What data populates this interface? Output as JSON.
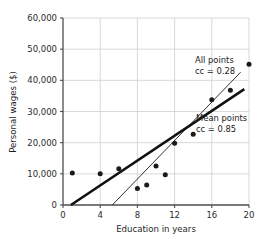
{
  "chart_data": {
    "type": "scatter",
    "title": "",
    "xlabel": "Education in years",
    "ylabel": "Personal wages ($)",
    "xlim": [
      0,
      20
    ],
    "ylim": [
      0,
      60000
    ],
    "grid": true,
    "legend_position": "inline-annotations",
    "xticks": [
      0,
      4,
      8,
      12,
      16,
      20
    ],
    "xtick_labels": [
      "0",
      "4",
      "8",
      "12",
      "16",
      "20"
    ],
    "yticks": [
      0,
      10000,
      20000,
      30000,
      40000,
      50000,
      60000
    ],
    "ytick_labels": [
      "0",
      "10,000",
      "20,000",
      "30,000",
      "40,000",
      "50,000",
      "60,000"
    ],
    "points": [
      {
        "x": 1.0,
        "y": 10300
      },
      {
        "x": 4.0,
        "y": 10000
      },
      {
        "x": 6.0,
        "y": 11600
      },
      {
        "x": 8.0,
        "y": 5300
      },
      {
        "x": 9.0,
        "y": 6400
      },
      {
        "x": 10.0,
        "y": 12500
      },
      {
        "x": 11.0,
        "y": 9700
      },
      {
        "x": 12.0,
        "y": 19800
      },
      {
        "x": 14.0,
        "y": 22700
      },
      {
        "x": 16.0,
        "y": 33800
      },
      {
        "x": 18.0,
        "y": 36800
      },
      {
        "x": 20.0,
        "y": 45200
      }
    ],
    "series": [
      {
        "name": "All points",
        "cc_label": "cc = 0.28",
        "cc": 0.28,
        "type": "line",
        "style": "thin",
        "x_start": 5.3,
        "y_start": 0,
        "x_end": 19.1,
        "y_end": 42600
      },
      {
        "name": "Mean points",
        "cc_label": "cc = 0.85",
        "cc": 0.85,
        "type": "line",
        "style": "thick",
        "x_start": 0.85,
        "y_start": 0,
        "x_end": 19.5,
        "y_end": 37200
      }
    ],
    "annotations": [
      {
        "name": "all-points",
        "line1": "All points",
        "line2": "cc = 0.28",
        "x": 15.6,
        "y": 44600
      },
      {
        "name": "mean-points",
        "line1": "Mean points",
        "line2": "cc = 0.85",
        "x": 15.7,
        "y": 26500
      }
    ]
  },
  "colors": {
    "grid": "#c9c9c9",
    "axis": "#4d4d4d",
    "point": "#1a1a1a",
    "line_all": "#333333",
    "line_mean": "#111111",
    "background": "#ffffff"
  }
}
